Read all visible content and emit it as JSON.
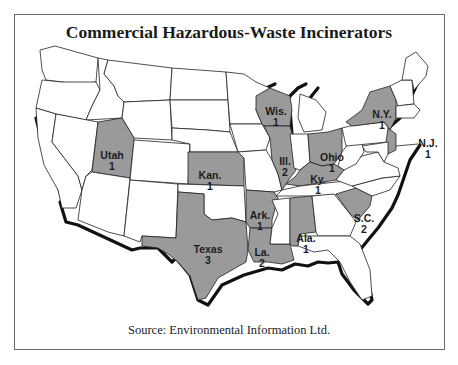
{
  "title": "Commercial Hazardous-Waste Incinerators",
  "source": "Source: Environmental Information Ltd.",
  "colors": {
    "highlighted_state": "#9a9a9a",
    "other_state": "#ffffff",
    "coastline_shadow": "#111111",
    "frame_border": "#6a6a6a"
  },
  "states": [
    {
      "name": "Utah",
      "count": "1"
    },
    {
      "name": "Kan.",
      "count": "1"
    },
    {
      "name": "Texas",
      "count": "3"
    },
    {
      "name": "Ark.",
      "count": "1"
    },
    {
      "name": "La.",
      "count": "2"
    },
    {
      "name": "Wis.",
      "count": "1"
    },
    {
      "name": "Ill.",
      "count": "2"
    },
    {
      "name": "Ky.",
      "count": "1"
    },
    {
      "name": "Ohio",
      "count": "1"
    },
    {
      "name": "Ala.",
      "count": "1"
    },
    {
      "name": "S.C.",
      "count": "2"
    },
    {
      "name": "N.Y.",
      "count": "1"
    },
    {
      "name": "N.J.",
      "count": "1"
    }
  ]
}
